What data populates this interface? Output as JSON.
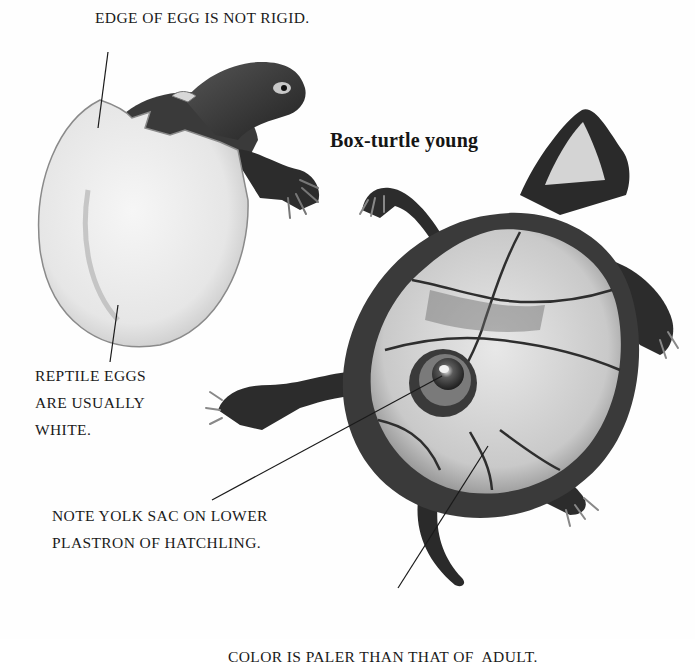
{
  "figure": {
    "title": "Box-turtle young",
    "colors": {
      "background": "#fefefe",
      "ink": "#1a1a1a",
      "egg": "#ececec",
      "plastron": "#d9d9d9",
      "skin_dark": "#2b2b2b"
    },
    "annotations": [
      {
        "id": "egg-edge",
        "lines": [
          "EDGE OF EGG IS NOT RIGID."
        ]
      },
      {
        "id": "egg-color",
        "lines": [
          "REPTILE EGGS",
          "ARE USUALLY",
          "WHITE."
        ]
      },
      {
        "id": "yolk-sac",
        "lines": [
          "NOTE YOLK SAC ON LOWER",
          "PLASTRON OF HATCHLING."
        ]
      },
      {
        "id": "hatchling-color",
        "lines": [
          "COLOR IS PALER THAN THAT OF  ADULT."
        ]
      }
    ],
    "illustrations": [
      {
        "id": "hatching-egg",
        "description": "hatchling turtle emerging from a white egg"
      },
      {
        "id": "upturned-hatchling",
        "description": "box-turtle hatchling on its back showing plastron and yolk sac"
      }
    ]
  }
}
